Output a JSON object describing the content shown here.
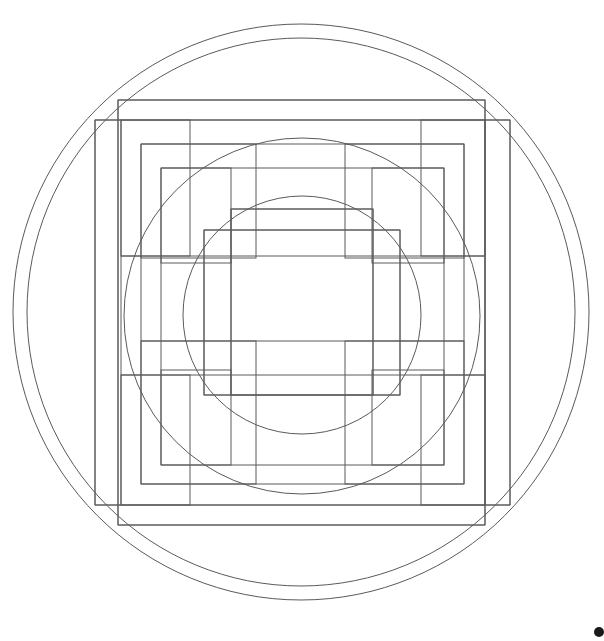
{
  "figure": {
    "canvas": {
      "width": 604,
      "height": 641,
      "background": "#ffffff"
    },
    "stroke": {
      "color": "#5a5a5a",
      "width": 1,
      "fill": "none"
    },
    "center": {
      "cx": 301,
      "cy": 312
    }
  },
  "chart_data": {
    "type": "scatter",
    "xlabel": "",
    "ylabel": "",
    "grid": false,
    "legend": "none",
    "xlim": [
      0,
      604
    ],
    "ylim": [
      0,
      641
    ],
    "circles": [
      {
        "name": "circle-outermost",
        "cx": 301,
        "cy": 312,
        "r": 288,
        "stroke": "#5a5a5a"
      },
      {
        "name": "circle-outer",
        "cx": 301,
        "cy": 312,
        "r": 274,
        "stroke": "#5a5a5a"
      },
      {
        "name": "circle-middle",
        "cx": 302,
        "cy": 316,
        "r": 178,
        "stroke": "#5a5a5a"
      },
      {
        "name": "circle-inner",
        "cx": 302,
        "cy": 315,
        "r": 119,
        "stroke": "#5a5a5a"
      }
    ],
    "rectangles": [
      {
        "name": "rect-outer-frame",
        "x": 118,
        "y": 100,
        "width": 367,
        "height": 425,
        "stroke": "#5a5a5a"
      },
      {
        "name": "rect-outer-tall",
        "x": 95,
        "y": 120,
        "width": 415,
        "height": 385,
        "stroke": "#5a5a5a"
      },
      {
        "name": "rect-band-upper-left",
        "x": 121,
        "y": 120,
        "width": 69,
        "height": 136,
        "stroke": "#5a5a5a"
      },
      {
        "name": "rect-band-upper-right",
        "x": 421,
        "y": 120,
        "width": 64,
        "height": 136,
        "stroke": "#5a5a5a"
      },
      {
        "name": "rect-band-lower-left",
        "x": 121,
        "y": 375,
        "width": 69,
        "height": 130,
        "stroke": "#5a5a5a"
      },
      {
        "name": "rect-band-lower-right",
        "x": 421,
        "y": 375,
        "width": 64,
        "height": 130,
        "stroke": "#5a5a5a"
      },
      {
        "name": "rect-mid-upper-left",
        "x": 141,
        "y": 144,
        "width": 115,
        "height": 114,
        "stroke": "#5a5a5a"
      },
      {
        "name": "rect-mid-upper-right",
        "x": 345,
        "y": 144,
        "width": 119,
        "height": 114,
        "stroke": "#5a5a5a"
      },
      {
        "name": "rect-mid-lower-left",
        "x": 141,
        "y": 341,
        "width": 115,
        "height": 143,
        "stroke": "#5a5a5a"
      },
      {
        "name": "rect-mid-lower-right",
        "x": 345,
        "y": 341,
        "width": 119,
        "height": 143,
        "stroke": "#5a5a5a"
      },
      {
        "name": "rect-inner-upper-left",
        "x": 161,
        "y": 168,
        "width": 70,
        "height": 95,
        "stroke": "#5a5a5a"
      },
      {
        "name": "rect-inner-upper-right",
        "x": 372,
        "y": 168,
        "width": 72,
        "height": 95,
        "stroke": "#5a5a5a"
      },
      {
        "name": "rect-inner-lower-left",
        "x": 161,
        "y": 370,
        "width": 70,
        "height": 95,
        "stroke": "#5a5a5a"
      },
      {
        "name": "rect-inner-lower-right",
        "x": 372,
        "y": 370,
        "width": 72,
        "height": 95,
        "stroke": "#5a5a5a"
      },
      {
        "name": "rect-core-outer",
        "x": 204,
        "y": 230,
        "width": 196,
        "height": 165,
        "stroke": "#5a5a5a"
      },
      {
        "name": "rect-core-inner",
        "x": 231,
        "y": 209,
        "width": 142,
        "height": 186,
        "stroke": "#5a5a5a"
      }
    ],
    "horizontal_lines": [
      {
        "name": "hline-top-frame",
        "y": 100,
        "x1": 118,
        "x2": 485
      },
      {
        "name": "hline-outer-tall-top",
        "y": 120,
        "x1": 95,
        "x2": 510
      },
      {
        "name": "hline-mid-top",
        "y": 144,
        "x1": 141,
        "x2": 464
      },
      {
        "name": "hline-inner-top",
        "y": 168,
        "x1": 161,
        "x2": 444
      },
      {
        "name": "hline-core-upper",
        "y": 209,
        "x1": 231,
        "x2": 373
      },
      {
        "name": "hline-core-band-upper",
        "y": 230,
        "x1": 204,
        "x2": 400
      },
      {
        "name": "hline-inner-band-upper",
        "y": 256,
        "x1": 121,
        "x2": 485
      },
      {
        "name": "hline-inner-band-lower",
        "y": 341,
        "x1": 141,
        "x2": 464
      },
      {
        "name": "hline-band-lower-top",
        "y": 375,
        "x1": 121,
        "x2": 485
      },
      {
        "name": "hline-core-band-lower",
        "y": 395,
        "x1": 204,
        "x2": 400
      },
      {
        "name": "hline-inner-lower",
        "y": 465,
        "x1": 161,
        "x2": 444
      },
      {
        "name": "hline-mid-lower",
        "y": 484,
        "x1": 141,
        "x2": 464
      },
      {
        "name": "hline-outer-tall-bottom",
        "y": 505,
        "x1": 95,
        "x2": 510
      },
      {
        "name": "hline-bottom-frame",
        "y": 525,
        "x1": 118,
        "x2": 485
      }
    ],
    "vertical_lines": [
      {
        "name": "vline-outer-left",
        "x": 95,
        "y1": 120,
        "y2": 505
      },
      {
        "name": "vline-frame-left",
        "x": 118,
        "y1": 100,
        "y2": 525
      },
      {
        "name": "vline-band-left",
        "x": 121,
        "y1": 120,
        "y2": 505
      },
      {
        "name": "vline-mid-left",
        "x": 141,
        "y1": 144,
        "y2": 484
      },
      {
        "name": "vline-inner-left",
        "x": 161,
        "y1": 168,
        "y2": 465
      },
      {
        "name": "vline-core-outer-left",
        "x": 204,
        "y1": 230,
        "y2": 395
      },
      {
        "name": "vline-core-inner-left",
        "x": 231,
        "y1": 209,
        "y2": 395
      },
      {
        "name": "vline-core-inner-right",
        "x": 373,
        "y1": 209,
        "y2": 395
      },
      {
        "name": "vline-core-outer-right",
        "x": 400,
        "y1": 230,
        "y2": 395
      },
      {
        "name": "vline-inner-right",
        "x": 444,
        "y1": 168,
        "y2": 465
      },
      {
        "name": "vline-mid-right",
        "x": 464,
        "y1": 144,
        "y2": 484
      },
      {
        "name": "vline-band-right",
        "x": 485,
        "y1": 120,
        "y2": 505
      },
      {
        "name": "vline-frame-right",
        "x": 485,
        "y1": 100,
        "y2": 525
      },
      {
        "name": "vline-outer-right",
        "x": 510,
        "y1": 120,
        "y2": 505
      }
    ],
    "corner_marker": {
      "name": "bottom-right-dot",
      "x": 599,
      "y": 632,
      "r": 5,
      "color": "#1a1a1a"
    }
  }
}
